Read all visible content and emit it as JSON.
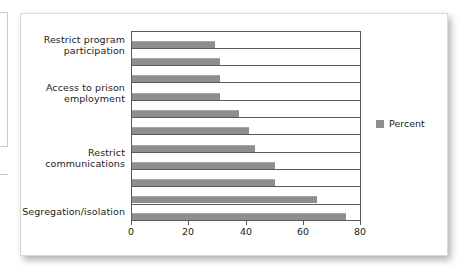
{
  "chart_data": {
    "type": "bar",
    "orientation": "horizontal",
    "title": "",
    "xlabel": "",
    "ylabel": "",
    "xlim": [
      0,
      80
    ],
    "xticks": [
      0,
      20,
      40,
      60,
      80
    ],
    "xtick_labels": [
      "0",
      "20",
      "40",
      "60",
      "80"
    ],
    "grid": true,
    "grid_axis": "y",
    "legend": {
      "position": "right",
      "entries": [
        {
          "label": "Percent",
          "color": "#8e8e8e"
        }
      ]
    },
    "category_labels": [
      "Restrict program\nparticipation",
      "Access to prison\nemployment",
      "Restrict\ncommunications",
      "Segregation/isolation"
    ],
    "categories": [
      "",
      "",
      "",
      "",
      "",
      "",
      "",
      "",
      "",
      "",
      ""
    ],
    "values": [
      29,
      31,
      31,
      31,
      37.5,
      41,
      43,
      50,
      50,
      65,
      75
    ],
    "series": [
      {
        "name": "Percent",
        "color": "#8e8e8e",
        "values": [
          29,
          31,
          31,
          31,
          37.5,
          41,
          43,
          50,
          50,
          65,
          75
        ]
      }
    ]
  },
  "legend": {
    "percent_label": "Percent"
  },
  "axis": {
    "tick_0": "0",
    "tick_1": "20",
    "tick_2": "40",
    "tick_3": "60",
    "tick_4": "80"
  },
  "labels": {
    "restrict_program": "Restrict program\nparticipation",
    "prison_employment": "Access to prison\nemployment",
    "restrict_communications": "Restrict\ncommunications",
    "segregation_isolation": "Segregation/isolation"
  }
}
